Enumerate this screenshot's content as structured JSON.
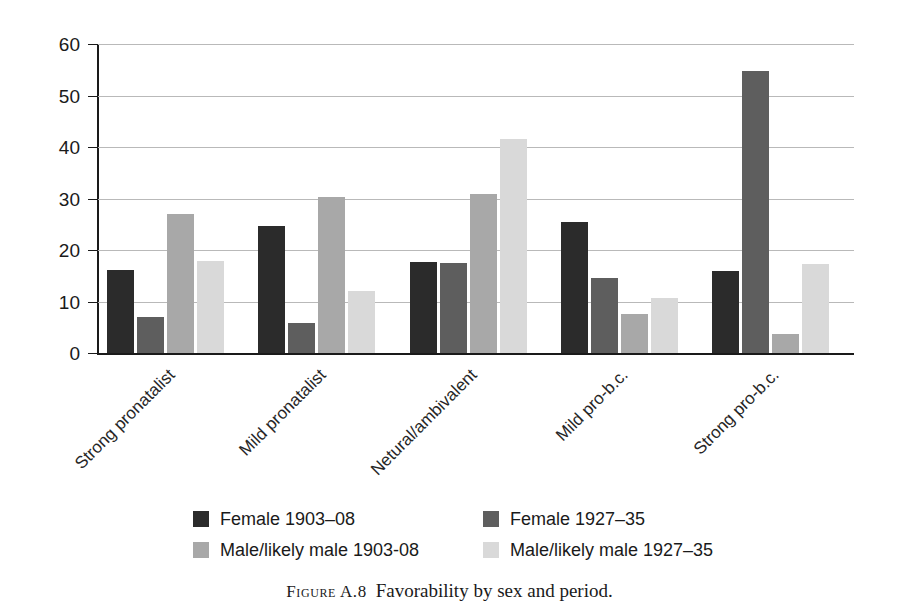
{
  "caption": {
    "tag": "Figure A.8",
    "text": "Favorability by sex and period."
  },
  "chart_data": {
    "type": "bar",
    "title": "",
    "xlabel": "",
    "ylabel": "",
    "ylim": [
      0,
      60
    ],
    "yticks": [
      0,
      10,
      20,
      30,
      40,
      50,
      60
    ],
    "grid": true,
    "legend_position": "bottom",
    "categories": [
      "Strong pronatalist",
      "Mild pronatalist",
      "Netural/ambivalent",
      "Mild pro-b.c.",
      "Strong pro-b.c."
    ],
    "series": [
      {
        "name": "Female 1903–08",
        "color": "#2b2b2b",
        "values": [
          16.2,
          24.6,
          17.6,
          25.5,
          15.9
        ]
      },
      {
        "name": "Female 1927–35",
        "color": "#5e5e5e",
        "values": [
          6.9,
          5.9,
          17.5,
          14.5,
          54.8
        ]
      },
      {
        "name": "Male/likely male 1903-08",
        "color": "#a8a8a8",
        "values": [
          26.9,
          30.3,
          30.9,
          7.5,
          3.6
        ]
      },
      {
        "name": "Male/likely male 1927–35",
        "color": "#d9d9d9",
        "values": [
          17.9,
          12.1,
          41.5,
          10.6,
          17.2
        ]
      }
    ]
  }
}
